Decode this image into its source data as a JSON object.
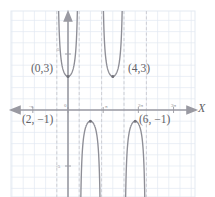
{
  "chart_data": {
    "type": "line",
    "title": "",
    "subtitle": "",
    "xlabel": "X",
    "ylabel": "",
    "grid": true,
    "legend": false,
    "xlim": [
      -4.2,
      10.8
    ],
    "ylim": [
      -8.5,
      8.5
    ],
    "x_ticks": [
      {
        "value": -3.1416,
        "label": "-π"
      },
      {
        "value": 0,
        "label": "0"
      },
      {
        "value": 3.1416,
        "label": "π"
      },
      {
        "value": 6.2832,
        "label": "2π"
      },
      {
        "value": 9.4248,
        "label": "3π"
      }
    ],
    "y_ticks": [
      {
        "value": 5,
        "label": "5"
      },
      {
        "value": -5,
        "label": "-5"
      }
    ],
    "asymptotes": [
      -1.0,
      1.0,
      3.0,
      5.0,
      7.0
    ],
    "annotations": [
      {
        "text": "(0,3)",
        "x": 0,
        "y": 3
      },
      {
        "text": "(4,3)",
        "x": 4,
        "y": 3
      },
      {
        "text": "(2, −1)",
        "x": 2,
        "y": -1
      },
      {
        "text": "(6, −1)",
        "x": 6,
        "y": -1
      }
    ],
    "markers": [
      {
        "x": 0,
        "y": 3
      },
      {
        "x": 4,
        "y": 3
      },
      {
        "x": 2,
        "y": -1
      },
      {
        "x": 6,
        "y": -1
      }
    ],
    "series": [
      {
        "name": "upper-branch-1",
        "orientation": "up",
        "vertex": {
          "x": 0,
          "y": 3
        },
        "asymptote_left": -1.0,
        "asymptote_right": 1.0
      },
      {
        "name": "lower-branch-1",
        "orientation": "down",
        "vertex": {
          "x": 2,
          "y": -1
        },
        "asymptote_left": 1.0,
        "asymptote_right": 3.0
      },
      {
        "name": "upper-branch-2",
        "orientation": "up",
        "vertex": {
          "x": 4,
          "y": 3
        },
        "asymptote_left": 3.0,
        "asymptote_right": 5.0
      },
      {
        "name": "lower-branch-2",
        "orientation": "down",
        "vertex": {
          "x": 6,
          "y": -1
        },
        "asymptote_left": 5.0,
        "asymptote_right": 7.0
      }
    ],
    "colors": {
      "grid": "#dfe6ef",
      "axis": "#9a9aa2",
      "curve": "#8e8e96",
      "asymptote": "#c9c9cf",
      "text": "#5f5f66",
      "marker": "#7a7a82",
      "frame": "#e3e9f1",
      "background": "#ffffff"
    }
  },
  "labels": {
    "point_0_3": "(0,3)",
    "point_4_3": "(4,3)",
    "point_2_m1": "(2, −1)",
    "point_6_m1": "(6, −1)",
    "tick_minus_pi": "-π",
    "tick_zero": "0",
    "tick_pi": "π",
    "tick_2pi": "2π",
    "tick_3pi": "3π",
    "tick_y5": "5",
    "tick_ym5": "-5",
    "axis_x": "X"
  }
}
